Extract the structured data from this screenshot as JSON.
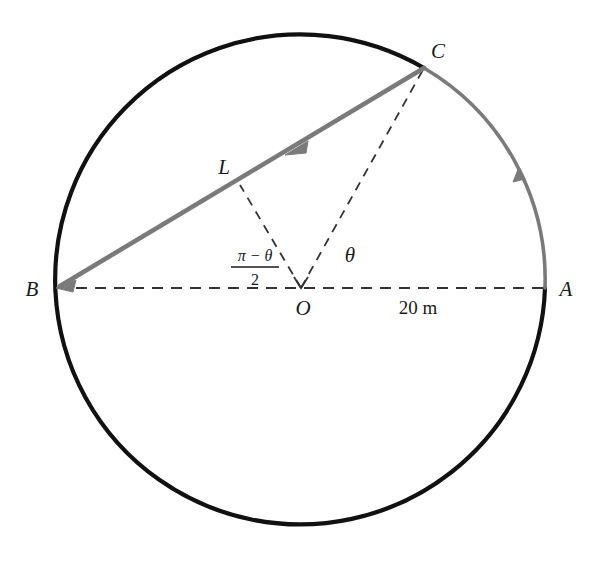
{
  "figure": {
    "type": "geometry-diagram",
    "background_color": "#ffffff",
    "colors": {
      "circle_stroke": "#111111",
      "highlight_stroke": "#7a7a7a",
      "dashed_stroke": "#333333",
      "label_color": "#1a1a1a"
    },
    "geometry": {
      "center": {
        "x": 301,
        "y": 288
      },
      "radius": 245,
      "points": {
        "A": {
          "x": 545,
          "y": 288
        },
        "B": {
          "x": 57,
          "y": 288
        },
        "C": {
          "x": 424,
          "y": 68
        },
        "O": {
          "x": 301,
          "y": 288
        },
        "L_foot": {
          "x": 240,
          "y": 185
        }
      }
    },
    "labels": [
      {
        "id": "label-A",
        "text": "A",
        "x": 566,
        "y": 295,
        "style": "italic"
      },
      {
        "id": "label-B",
        "text": "B",
        "x": 30,
        "y": 295,
        "style": "italic"
      },
      {
        "id": "label-C",
        "text": "C",
        "x": 436,
        "y": 52,
        "style": "italic"
      },
      {
        "id": "label-O",
        "text": "O",
        "x": 295,
        "y": 312,
        "style": "italic"
      },
      {
        "id": "label-L",
        "text": "L",
        "x": 218,
        "y": 172,
        "style": "italic"
      },
      {
        "id": "label-theta",
        "text": "θ",
        "x": 348,
        "y": 262,
        "style": "italic"
      },
      {
        "id": "label-radius",
        "text": "20 m",
        "x": 396,
        "y": 312,
        "style": "upright"
      }
    ],
    "fraction_label": {
      "id": "label-half-pi-minus-theta",
      "numerator": "π − θ",
      "denominator": "2",
      "plain": "(π−θ)/2",
      "x": 255,
      "y": 262
    },
    "segments": [
      {
        "id": "diameter-BA",
        "from": "B",
        "to": "A",
        "style": "dashed",
        "color": "#333333"
      },
      {
        "id": "chord-CB",
        "from": "C",
        "to": "B",
        "style": "solid",
        "color": "#7a7a7a",
        "arrow": "toward-B"
      },
      {
        "id": "radius-OC",
        "from": "O",
        "to": "C",
        "style": "dashed",
        "color": "#333333"
      },
      {
        "id": "perpendicular-OL",
        "from": "O",
        "to": "L_foot",
        "style": "dashed",
        "color": "#333333"
      }
    ],
    "arcs": [
      {
        "id": "arc-A-to-C-highlight",
        "from": "A",
        "to": "C",
        "color": "#7a7a7a",
        "arrow": "toward-C"
      },
      {
        "id": "arc-C-around-to-A-main",
        "from": "C",
        "to": "A",
        "color": "#111111",
        "direction": "counterclockwise-major"
      }
    ],
    "arrow_markers": [
      {
        "id": "arrow-chord",
        "x": 297,
        "y": 148,
        "points_to": "B"
      },
      {
        "id": "arrow-arc",
        "x": 518,
        "y": 172,
        "points_to": "C"
      }
    ]
  }
}
